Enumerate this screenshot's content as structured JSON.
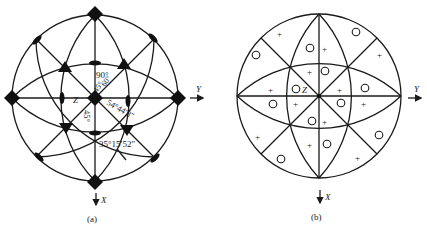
{
  "figure": {
    "panel_a": {
      "caption": "(a)",
      "axis_labels": {
        "y": "Y",
        "x": "X",
        "z": "Z"
      },
      "angle_labels": [
        "90°",
        "45°",
        "60°",
        "54°44′8″",
        "45°",
        "35°15′52″"
      ],
      "symbols": {
        "fourfold": "diamond",
        "threefold": "triangle",
        "twofold": "lens"
      }
    },
    "panel_b": {
      "caption": "(b)",
      "axis_labels": {
        "y": "Y",
        "x": "X",
        "z": "Z"
      },
      "markers": {
        "plus": "+",
        "circle": "○"
      }
    }
  }
}
